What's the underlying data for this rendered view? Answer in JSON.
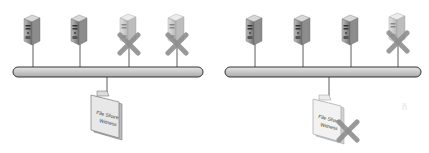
{
  "diagrams": [
    {
      "name": "left",
      "servers": [
        {
          "id": 1,
          "failed": false
        },
        {
          "id": 2,
          "failed": false
        },
        {
          "id": 3,
          "failed": true
        },
        {
          "id": 4,
          "failed": true
        }
      ],
      "witness": {
        "line1": "File Share",
        "line2": "Witness",
        "failed": false
      }
    },
    {
      "name": "right",
      "servers": [
        {
          "id": 1,
          "failed": false
        },
        {
          "id": 2,
          "failed": false
        },
        {
          "id": 3,
          "failed": false
        },
        {
          "id": 4,
          "failed": true
        }
      ],
      "witness": {
        "line1": "File Share",
        "line2": "Witness",
        "failed": true
      }
    }
  ],
  "colors": {
    "bus": "#c8c8c8",
    "server_body": "#9a9a9a",
    "server_failed": "#cfcfcf",
    "cross": "#8a8a8a"
  }
}
